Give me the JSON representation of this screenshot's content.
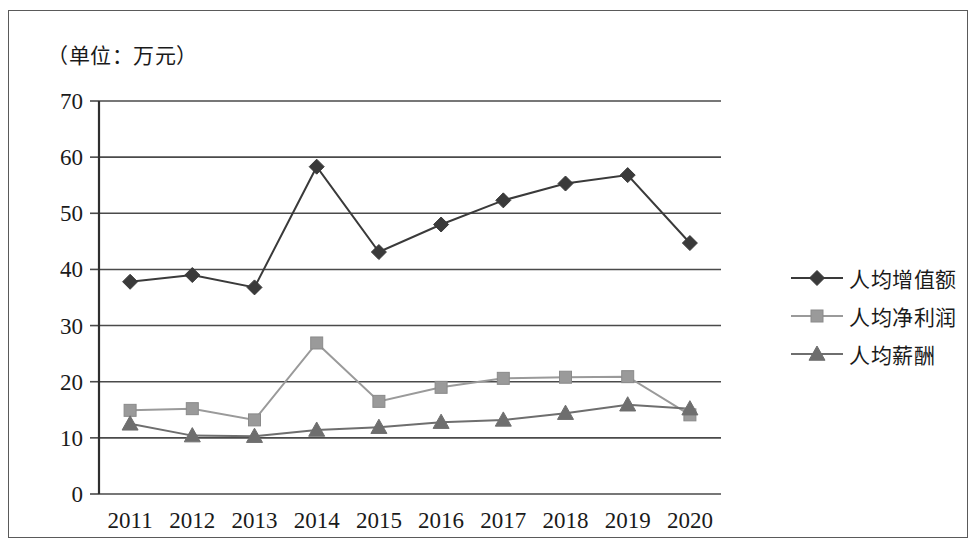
{
  "figure": {
    "unit_label": "（单位：万元）"
  },
  "legend": {
    "items": [
      {
        "label": "人均增值额",
        "marker": "diamond-marker-icon",
        "color": "#3a3a3a"
      },
      {
        "label": "人均净利润",
        "marker": "square-marker-icon",
        "color": "#9a9a9a"
      },
      {
        "label": "人均薪酬",
        "marker": "triangle-marker-icon",
        "color": "#6e6e6e"
      }
    ]
  },
  "chart_data": {
    "type": "line",
    "title": "",
    "subtitle": "",
    "xlabel": "",
    "ylabel": "（单位：万元）",
    "categories": [
      "2011",
      "2012",
      "2013",
      "2014",
      "2015",
      "2016",
      "2017",
      "2018",
      "2019",
      "2020"
    ],
    "ylim": [
      0,
      70
    ],
    "yticks": [
      0,
      10,
      20,
      30,
      40,
      50,
      60,
      70
    ],
    "grid": true,
    "legend_position": "right",
    "series": [
      {
        "name": "人均增值额",
        "marker": "diamond",
        "color": "#3a3a3a",
        "values": [
          37.8,
          39.0,
          36.8,
          58.3,
          43.1,
          48.0,
          52.3,
          55.3,
          56.8,
          44.7
        ]
      },
      {
        "name": "人均净利润",
        "marker": "square",
        "color": "#9a9a9a",
        "values": [
          14.9,
          15.2,
          13.2,
          26.9,
          16.5,
          19.0,
          20.6,
          20.8,
          20.9,
          14.1
        ]
      },
      {
        "name": "人均薪酬",
        "marker": "triangle",
        "color": "#6e6e6e",
        "values": [
          12.5,
          10.4,
          10.3,
          11.4,
          11.9,
          12.8,
          13.2,
          14.4,
          15.9,
          15.2
        ]
      }
    ]
  }
}
